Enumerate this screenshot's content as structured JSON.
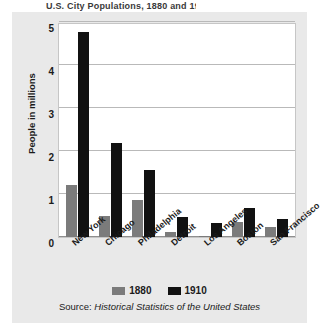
{
  "figure": {
    "caption_sliver": "U.S. City Populations, 1880 and 1910",
    "source_label": "Source:",
    "source_title": "Historical Statistics of the United States",
    "background_color": "#e9e9e9",
    "plot_background_color": "#ffffff"
  },
  "legend": {
    "position": "bottom",
    "items": [
      {
        "label": "1880",
        "color": "#7b7b7b"
      },
      {
        "label": "1910",
        "color": "#111111"
      }
    ]
  },
  "chart_data": {
    "type": "bar",
    "title": "",
    "xlabel": "",
    "ylabel": "People in millions",
    "ylim": [
      0,
      5
    ],
    "yticks": [
      0,
      1,
      2,
      3,
      4,
      5
    ],
    "ytick_labels": [
      "0",
      "1",
      "2",
      "3",
      "4",
      "5"
    ],
    "grid": true,
    "legend_position": "bottom",
    "categories": [
      "New York",
      "Chicago",
      "Philadelphia",
      "Detroit",
      "Los Angeles",
      "Boston",
      "San Francisco"
    ],
    "series": [
      {
        "name": "1880",
        "color": "#7b7b7b",
        "values": [
          1.2,
          0.5,
          0.85,
          0.12,
          0.01,
          0.36,
          0.23
        ]
      },
      {
        "name": "1910",
        "color": "#111111",
        "values": [
          4.77,
          2.18,
          1.55,
          0.47,
          0.32,
          0.67,
          0.42
        ]
      }
    ]
  }
}
